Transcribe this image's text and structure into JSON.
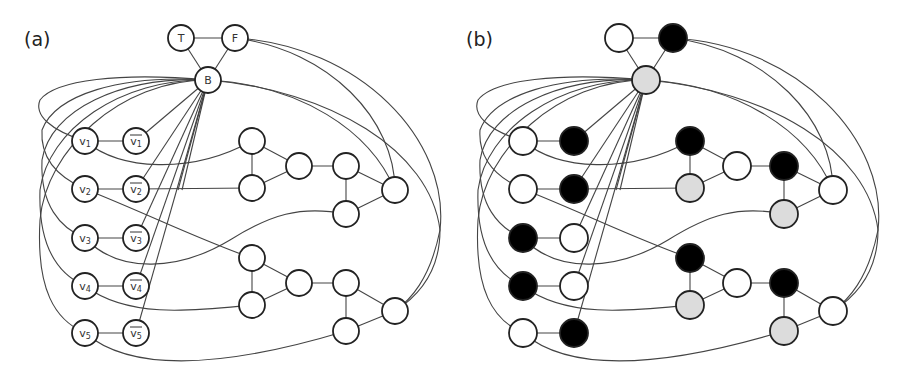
{
  "figure": {
    "panels": [
      {
        "id": "a",
        "label": "(a)",
        "offset_x": 0,
        "node_radius": 13,
        "show_labels": true
      },
      {
        "id": "b",
        "label": "(b)",
        "offset_x": 438,
        "node_radius": 14,
        "show_labels": false
      }
    ],
    "colors": {
      "edge": "#444444",
      "node_stroke": "#222222",
      "white": "#ffffff",
      "black": "#000000",
      "gray": "#dcdcdc",
      "label": "#333333"
    },
    "nodes": [
      {
        "id": "T",
        "label": "T",
        "overline": false,
        "x": 181,
        "y": 38,
        "color_b": "white"
      },
      {
        "id": "F",
        "label": "F",
        "overline": false,
        "x": 235,
        "y": 38,
        "color_b": "black"
      },
      {
        "id": "B",
        "label": "B",
        "overline": false,
        "x": 208,
        "y": 80,
        "color_b": "gray"
      },
      {
        "id": "v1",
        "label": "v1",
        "overline": false,
        "x": 85,
        "y": 141,
        "color_b": "white"
      },
      {
        "id": "nv1",
        "label": "v1",
        "overline": true,
        "x": 136,
        "y": 141,
        "color_b": "black"
      },
      {
        "id": "v2",
        "label": "v2",
        "overline": false,
        "x": 85,
        "y": 189,
        "color_b": "white"
      },
      {
        "id": "nv2",
        "label": "v2",
        "overline": true,
        "x": 136,
        "y": 189,
        "color_b": "black"
      },
      {
        "id": "v3",
        "label": "v3",
        "overline": false,
        "x": 85,
        "y": 238,
        "color_b": "black"
      },
      {
        "id": "nv3",
        "label": "v3",
        "overline": true,
        "x": 136,
        "y": 238,
        "color_b": "white"
      },
      {
        "id": "v4",
        "label": "v4",
        "overline": false,
        "x": 85,
        "y": 286,
        "color_b": "black"
      },
      {
        "id": "nv4",
        "label": "v4",
        "overline": true,
        "x": 136,
        "y": 286,
        "color_b": "white"
      },
      {
        "id": "v5",
        "label": "v5",
        "overline": false,
        "x": 85,
        "y": 333,
        "color_b": "white"
      },
      {
        "id": "nv5",
        "label": "v5",
        "overline": true,
        "x": 136,
        "y": 333,
        "color_b": "black"
      },
      {
        "id": "a1",
        "label": "",
        "overline": false,
        "x": 252,
        "y": 141,
        "color_b": "black"
      },
      {
        "id": "a2",
        "label": "",
        "overline": false,
        "x": 252,
        "y": 188,
        "color_b": "gray"
      },
      {
        "id": "a3",
        "label": "",
        "overline": false,
        "x": 299,
        "y": 166,
        "color_b": "white"
      },
      {
        "id": "a4",
        "label": "",
        "overline": false,
        "x": 346,
        "y": 166,
        "color_b": "black"
      },
      {
        "id": "a5",
        "label": "",
        "overline": false,
        "x": 346,
        "y": 214,
        "color_b": "gray"
      },
      {
        "id": "a6",
        "label": "",
        "overline": false,
        "x": 395,
        "y": 190,
        "color_b": "white"
      },
      {
        "id": "b1",
        "label": "",
        "overline": false,
        "x": 252,
        "y": 258,
        "color_b": "black"
      },
      {
        "id": "b2",
        "label": "",
        "overline": false,
        "x": 252,
        "y": 305,
        "color_b": "gray"
      },
      {
        "id": "b3",
        "label": "",
        "overline": false,
        "x": 299,
        "y": 283,
        "color_b": "white"
      },
      {
        "id": "b4",
        "label": "",
        "overline": false,
        "x": 346,
        "y": 283,
        "color_b": "black"
      },
      {
        "id": "b5",
        "label": "",
        "overline": false,
        "x": 346,
        "y": 331,
        "color_b": "gray"
      },
      {
        "id": "b6",
        "label": "",
        "overline": false,
        "x": 395,
        "y": 311,
        "color_b": "white"
      }
    ],
    "edges": [
      {
        "d": "M181,38 L235,38"
      },
      {
        "d": "M181,38 L208,80"
      },
      {
        "d": "M235,38 L208,80"
      },
      {
        "d": "M85,141 L136,141"
      },
      {
        "d": "M85,189 L136,189"
      },
      {
        "d": "M85,238 L136,238"
      },
      {
        "d": "M85,286 L136,286"
      },
      {
        "d": "M85,333 L136,333"
      },
      {
        "d": "M208,80 L136,141"
      },
      {
        "d": "M208,80 L136,189"
      },
      {
        "d": "M208,80 L136,238"
      },
      {
        "d": "M208,80 L136,286"
      },
      {
        "d": "M208,80 L136,333"
      },
      {
        "d": "M208,80 L178,190"
      },
      {
        "d": "M208,80 L182,190"
      },
      {
        "d": "M208,80 C120,72 55,80 40,100 C34,115 50,130 85,141"
      },
      {
        "d": "M208,80 C120,74 55,95 42,130 C40,160 60,178 85,189"
      },
      {
        "d": "M208,80 C120,76 50,110 42,160 C40,205 60,228 85,238"
      },
      {
        "d": "M208,80 C120,78 48,130 40,190 C38,250 60,275 85,286"
      },
      {
        "d": "M208,80 C120,80 46,150 40,220 C36,290 55,320 85,333"
      },
      {
        "d": "M252,141 L252,188"
      },
      {
        "d": "M252,141 L299,166"
      },
      {
        "d": "M252,188 L299,166"
      },
      {
        "d": "M299,166 L346,166"
      },
      {
        "d": "M346,166 L346,214"
      },
      {
        "d": "M346,166 L395,190"
      },
      {
        "d": "M346,214 L395,190"
      },
      {
        "d": "M252,258 L252,305"
      },
      {
        "d": "M252,258 L299,283"
      },
      {
        "d": "M252,305 L299,283"
      },
      {
        "d": "M299,283 L346,283"
      },
      {
        "d": "M346,283 L346,331"
      },
      {
        "d": "M346,283 L395,311"
      },
      {
        "d": "M346,331 L395,311"
      },
      {
        "d": "M85,141 C120,170 190,175 252,141"
      },
      {
        "d": "M136,189 L252,188"
      },
      {
        "d": "M85,189 C150,215 200,240 252,258"
      },
      {
        "d": "M85,238 C120,275 180,270 230,240 C270,215 300,205 346,214"
      },
      {
        "d": "M85,286 C130,320 200,310 252,305"
      },
      {
        "d": "M85,333 C140,380 250,360 346,331"
      },
      {
        "d": "M235,38 C330,50 395,120 395,190"
      },
      {
        "d": "M235,38 C360,45 450,140 440,230 C430,280 410,300 395,311"
      },
      {
        "d": "M208,80 C300,85 370,130 395,190"
      },
      {
        "d": "M208,80 C330,90 430,150 440,230 C440,270 420,295 395,311"
      }
    ]
  }
}
